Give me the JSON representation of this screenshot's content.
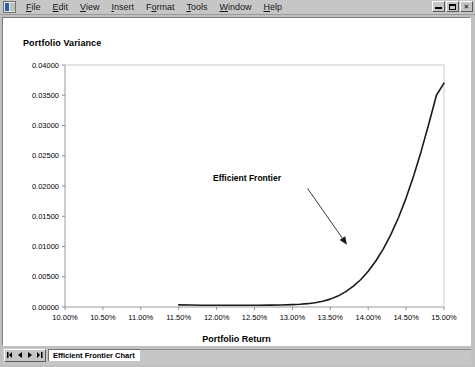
{
  "window": {
    "icon": "excel-workbook-icon",
    "menus": [
      {
        "label": "File",
        "accel": "F"
      },
      {
        "label": "Edit",
        "accel": "E"
      },
      {
        "label": "View",
        "accel": "V"
      },
      {
        "label": "Insert",
        "accel": "I"
      },
      {
        "label": "Format",
        "accel": "o"
      },
      {
        "label": "Tools",
        "accel": "T"
      },
      {
        "label": "Window",
        "accel": "W"
      },
      {
        "label": "Help",
        "accel": "H"
      }
    ],
    "controls": {
      "minimize": "minimize-button",
      "restore": "restore-button",
      "close": "close-button"
    }
  },
  "sheet_tabs": {
    "nav": [
      "first-sheet",
      "previous-sheet",
      "next-sheet",
      "last-sheet"
    ],
    "tabs": [
      {
        "label": "Efficient Frontier Chart",
        "active": true
      }
    ]
  },
  "chart_data": {
    "type": "line",
    "title": "",
    "xlabel": "Portfolio Return",
    "ylabel": "Portfolio Variance",
    "xlim": [
      0.1,
      0.15
    ],
    "ylim": [
      0.0,
      0.04
    ],
    "grid": false,
    "legend": "none",
    "xtick_labels": [
      "10.00%",
      "10.50%",
      "11.00%",
      "11.50%",
      "12.00%",
      "12.50%",
      "13.00%",
      "13.50%",
      "14.00%",
      "14.50%",
      "15.00%"
    ],
    "xtick_values": [
      0.1,
      0.105,
      0.11,
      0.115,
      0.12,
      0.125,
      0.13,
      0.135,
      0.14,
      0.145,
      0.15
    ],
    "ytick_labels": [
      "0.00000",
      "0.00500",
      "0.01000",
      "0.01500",
      "0.02000",
      "0.02500",
      "0.03000",
      "0.03500",
      "0.04000"
    ],
    "ytick_values": [
      0.0,
      0.005,
      0.01,
      0.015,
      0.02,
      0.025,
      0.03,
      0.035,
      0.04
    ],
    "series": [
      {
        "name": "Efficient Frontier",
        "color": "#1a1a1a",
        "x": [
          0.115,
          0.1165,
          0.118,
          0.1195,
          0.121,
          0.1225,
          0.124,
          0.1255,
          0.127,
          0.1285,
          0.13,
          0.131,
          0.132,
          0.133,
          0.134,
          0.135,
          0.136,
          0.137,
          0.138,
          0.139,
          0.14,
          0.141,
          0.142,
          0.143,
          0.144,
          0.145,
          0.146,
          0.147,
          0.148,
          0.149,
          0.15
        ],
        "y": [
          0.00035,
          0.00032,
          0.0003,
          0.00029,
          0.00028,
          0.00028,
          0.00028,
          0.00029,
          0.00031,
          0.00034,
          0.0004,
          0.00046,
          0.00055,
          0.0007,
          0.00094,
          0.0013,
          0.0018,
          0.0025,
          0.0034,
          0.0045,
          0.0059,
          0.0076,
          0.0096,
          0.012,
          0.0148,
          0.018,
          0.0217,
          0.0258,
          0.0303,
          0.035,
          0.037
        ]
      }
    ],
    "annotations": [
      {
        "text": "Efficient Frontier",
        "text_x": 0.1285,
        "text_y": 0.0208,
        "arrow_from_x": 0.132,
        "arrow_from_y": 0.0196,
        "arrow_to_x": 0.1372,
        "arrow_to_y": 0.0103
      }
    ]
  }
}
